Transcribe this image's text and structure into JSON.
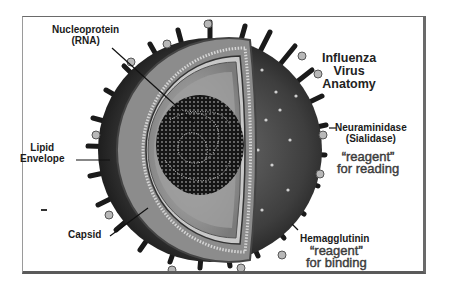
{
  "diagram": {
    "title": [
      "Influenza",
      "Virus",
      "Anatomy"
    ],
    "labels": {
      "nucleoprotein": [
        "Nucleoprotein",
        "(RNA)"
      ],
      "lipid_envelope": [
        "Lipid",
        "Envelope"
      ],
      "capsid": "Capsid",
      "neuraminidase": [
        "Neuraminidase",
        "(Sialidase)"
      ],
      "neuraminidase_note": [
        "“reagent”",
        "for reading"
      ],
      "hemagglutinin": "Hemagglutinin",
      "hemagglutinin_note": [
        "“reagent”",
        "for binding"
      ]
    },
    "colors": {
      "background": "#ffffff",
      "frame": "#6a6a6a",
      "virus_dark": "#2a2a2a",
      "virus_mid": "#6b6b6b",
      "membrane": "#9a9a9a",
      "core": "#1c1c1c"
    }
  }
}
